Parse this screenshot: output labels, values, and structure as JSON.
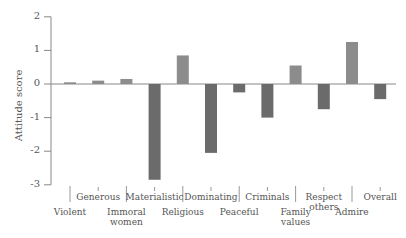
{
  "chart_data": {
    "type": "bar",
    "title": "",
    "xlabel": "",
    "ylabel": "Attitude score",
    "ylim": [
      -3,
      2
    ],
    "yticks": [
      2,
      1,
      0,
      -1,
      -2,
      -3
    ],
    "grid": false,
    "legend": null,
    "categories": [
      "Violent",
      "Generous",
      "Immoral women",
      "Materialistic",
      "Religious",
      "Dominating",
      "Peaceful",
      "Criminals",
      "Family values",
      "Respect others",
      "Admire",
      "Overall"
    ],
    "values": [
      0.05,
      0.1,
      0.15,
      -2.85,
      0.85,
      -2.05,
      -0.25,
      -1.0,
      0.55,
      -0.75,
      1.25,
      -0.45
    ],
    "colors": {
      "positive": "#8c8c8c",
      "negative": "#6b6b6b",
      "axis": "#888888"
    }
  },
  "labels": {
    "ylabel": "Attitude score",
    "ticks": [
      "2",
      "1",
      "0",
      "-1",
      "-2",
      "-3"
    ],
    "categories": [
      {
        "text": "Violent",
        "row": "low"
      },
      {
        "text": "Generous",
        "row": "high"
      },
      {
        "text": "Immoral\nwomen",
        "row": "low"
      },
      {
        "text": "Materialistic",
        "row": "high"
      },
      {
        "text": "Religious",
        "row": "low"
      },
      {
        "text": "Dominating",
        "row": "high"
      },
      {
        "text": "Peaceful",
        "row": "low"
      },
      {
        "text": "Criminals",
        "row": "high"
      },
      {
        "text": "Family\nvalues",
        "row": "low"
      },
      {
        "text": "Respect\nothers",
        "row": "high"
      },
      {
        "text": "Admire",
        "row": "low"
      },
      {
        "text": "Overall",
        "row": "high"
      }
    ]
  }
}
